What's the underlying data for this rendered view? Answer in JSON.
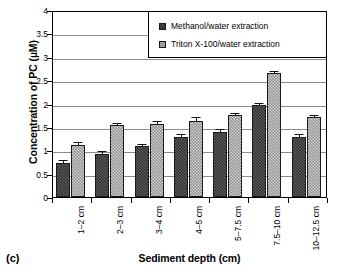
{
  "panel_label": "(c)",
  "legend": {
    "position": "top-right-inside",
    "entries": [
      {
        "label": "Methanol/water extraction",
        "swatch": "dark-hatched-square",
        "color": "#4f4f4f"
      },
      {
        "label": "Triton X-100/water extraction",
        "swatch": "light-hatched-square",
        "color": "#b4b4b4"
      }
    ]
  },
  "chart_data": {
    "type": "bar",
    "title": "",
    "subtitle": "",
    "xlabel": "Sediment depth (cm)",
    "ylabel": "Concentration of PC (µM)",
    "categories": [
      "1–2 cm",
      "2–3 cm",
      "3–4 cm",
      "4–5 cm",
      "5–7.5 cm",
      "7.5–10 cm",
      "10–12.5 cm"
    ],
    "ylim": [
      0,
      4
    ],
    "yticks": [
      0,
      0.5,
      1,
      1.5,
      2,
      2.5,
      3,
      3.5,
      4
    ],
    "ytick_labels": [
      "0",
      "0.5",
      "1",
      "1.5",
      "2",
      "2.5",
      "3",
      "3.5",
      "4"
    ],
    "grid": "horizontal",
    "error_bars": true,
    "series": [
      {
        "name": "Methanol/water extraction",
        "color": "#4f4f4f",
        "values": [
          0.73,
          0.93,
          1.09,
          1.28,
          1.4,
          1.97,
          1.29
        ],
        "errors": [
          0.03,
          0.03,
          0.03,
          0.04,
          0.03,
          0.02,
          0.04
        ]
      },
      {
        "name": "Triton X-100/water extraction",
        "color": "#b4b4b4",
        "values": [
          1.12,
          1.54,
          1.57,
          1.63,
          1.76,
          2.65,
          1.71
        ],
        "errors": [
          0.03,
          0.02,
          0.03,
          0.05,
          0.02,
          0.03,
          0.03
        ]
      }
    ]
  }
}
